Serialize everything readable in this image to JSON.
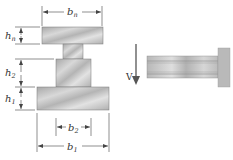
{
  "figure": {
    "cross_section": {
      "dimensions": {
        "top_width": {
          "base": "b",
          "sub": "n"
        },
        "top_height": {
          "base": "h",
          "sub": "n"
        },
        "middle_height": {
          "base": "h",
          "sub": "2"
        },
        "bottom_height": {
          "base": "h",
          "sub": "1"
        },
        "middle_width": {
          "base": "b",
          "sub": "2"
        },
        "bottom_width": {
          "base": "b",
          "sub": "1"
        }
      },
      "parts": [
        "top-flange",
        "neck",
        "middle-block",
        "bottom-flange"
      ]
    },
    "beam_side_view": {
      "load_label": "V",
      "support": "fixed-wall"
    },
    "colors": {
      "fill_light": "#e6e6e6",
      "fill_mid": "#c8c8c8",
      "fill_dark": "#a9a9a9",
      "line": "#555555",
      "text": "#333333"
    }
  }
}
